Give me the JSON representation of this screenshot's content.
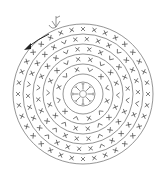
{
  "diagram": {
    "type": "crochet-chart-round",
    "title": "",
    "center": {
      "x": 83,
      "y": 94
    },
    "colors": {
      "line": "#7a7a7a",
      "symbol": "#555555",
      "arrow": "#222222",
      "background": "#ffffff"
    },
    "rings": [
      {
        "r": 70
      },
      {
        "r": 60
      },
      {
        "r": 50
      },
      {
        "r": 40
      },
      {
        "r": 30
      },
      {
        "r": 20
      }
    ],
    "magic_ring": {
      "r": 12,
      "inner_r": 3.5,
      "spokes": 8
    },
    "rounds": [
      {
        "r": 65,
        "count": 36,
        "symbols": "x,x,x,x,x,x,x,x,x,x,x,x,x,x,x,x,x,x,x,x,x,x,x,x,x,x,x,x,x,x,x,x,x,x,x,x"
      },
      {
        "r": 55,
        "count": 30,
        "symbols": "x,x,x,v,x,x,x,x,v,x,x,x,x,v,x,x,x,x,v,x,x,x,x,v,x,x,x,x,v,x"
      },
      {
        "r": 45,
        "count": 24,
        "symbols": "x,x,v,x,x,x,v,x,x,x,v,x,x,x,v,x,x,x,v,x,x,x,v,x"
      },
      {
        "r": 35,
        "count": 18,
        "symbols": "x,v,x,x,v,x,x,v,x,x,v,x,x,v,x,x,v,x"
      },
      {
        "r": 25,
        "count": 12,
        "symbols": "v,x,v,x,v,x,v,x,v,x,v,x"
      }
    ],
    "legend": {
      "start_marker": "chain-start-symbol",
      "direction": "counter-clockwise",
      "symbol_x": "single crochet",
      "symbol_v": "increase"
    }
  }
}
